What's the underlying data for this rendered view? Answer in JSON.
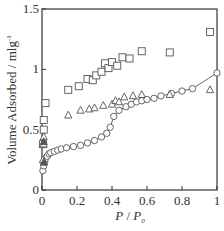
{
  "chart_data": {
    "type": "scatter",
    "title": "",
    "xlabel": "P / P0",
    "xlabel_parts": {
      "main": "P",
      "sep": " / ",
      "main2": "P",
      "sub": "0"
    },
    "ylabel": "Volume Adsorbed / mlg-1",
    "ylabel_parts": {
      "main": "Volume Adsorbed / mlg",
      "sup": "-1"
    },
    "xlim": [
      0,
      1
    ],
    "ylim": [
      0,
      1.5
    ],
    "xticks": [
      0,
      0.2,
      0.4,
      0.6,
      0.8,
      1
    ],
    "xtick_labels": [
      "0",
      "0.2",
      "0.4",
      "0.6",
      "0.8",
      "1"
    ],
    "yticks": [
      0,
      0.5,
      1,
      1.5
    ],
    "ytick_labels": [
      "0",
      "0.5",
      "1",
      "1.5"
    ],
    "grid": false,
    "legend": null,
    "series": [
      {
        "name": "squares",
        "marker": "square",
        "line": false,
        "x": [
          0.005,
          0.01,
          0.01,
          0.02,
          0.15,
          0.21,
          0.26,
          0.29,
          0.31,
          0.34,
          0.36,
          0.38,
          0.4,
          0.43,
          0.46,
          0.5,
          0.57,
          0.73,
          0.96
        ],
        "y": [
          0.38,
          0.5,
          0.58,
          0.72,
          0.83,
          0.86,
          0.92,
          0.91,
          0.95,
          0.98,
          1.05,
          1.01,
          1.06,
          1.03,
          1.1,
          1.09,
          1.15,
          1.14,
          1.31
        ]
      },
      {
        "name": "circles",
        "marker": "circle",
        "line": true,
        "x": [
          0.005,
          0.01,
          0.015,
          0.02,
          0.03,
          0.04,
          0.05,
          0.07,
          0.09,
          0.11,
          0.14,
          0.18,
          0.22,
          0.26,
          0.3,
          0.34,
          0.37,
          0.39,
          0.41,
          0.44,
          0.48,
          0.51,
          0.54,
          0.57,
          0.6,
          0.64,
          0.68,
          0.74,
          0.8,
          0.86,
          1.0
        ],
        "y": [
          0.16,
          0.2,
          0.23,
          0.26,
          0.28,
          0.3,
          0.31,
          0.32,
          0.33,
          0.34,
          0.35,
          0.36,
          0.37,
          0.39,
          0.41,
          0.44,
          0.47,
          0.52,
          0.61,
          0.66,
          0.69,
          0.71,
          0.73,
          0.74,
          0.75,
          0.76,
          0.78,
          0.8,
          0.82,
          0.84,
          0.97
        ]
      },
      {
        "name": "triangles",
        "marker": "triangle",
        "line": false,
        "x": [
          0.005,
          0.01,
          0.01,
          0.15,
          0.22,
          0.27,
          0.3,
          0.35,
          0.4,
          0.42,
          0.44,
          0.47,
          0.52,
          0.57,
          0.73,
          0.96
        ],
        "y": [
          0.25,
          0.38,
          0.44,
          0.62,
          0.66,
          0.67,
          0.68,
          0.7,
          0.71,
          0.74,
          0.73,
          0.77,
          0.78,
          0.79,
          0.79,
          0.83
        ]
      }
    ],
    "extra_markers": [
      {
        "marker": "filled-triangle",
        "x": 0.01,
        "y": 0.4
      },
      {
        "marker": "filled-triangle",
        "x": 0.01,
        "y": 0.23
      }
    ],
    "colors": {
      "marker_stroke": "#555555",
      "axis": "#333333",
      "line": "#555555"
    }
  }
}
